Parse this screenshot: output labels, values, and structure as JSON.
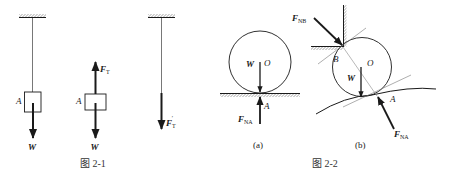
{
  "figure_2_1": {
    "caption": "图 2-1",
    "panel_1": {
      "point_label": "A",
      "weight_label": "W"
    },
    "panel_2": {
      "point_label": "A",
      "weight_label": "W",
      "tension_label": "F",
      "tension_sub": "T"
    },
    "panel_3": {
      "tension_label": "F",
      "tension_sub": "T",
      "tension_prime": "′"
    }
  },
  "figure_2_2": {
    "caption": "图 2-2",
    "panel_a": {
      "label": "(a)",
      "center_label": "O",
      "weight_label": "W",
      "contact_label": "A",
      "normal_label": "F",
      "normal_sub": "NA"
    },
    "panel_b": {
      "label": "(b)",
      "center_label": "O",
      "weight_label": "W",
      "contact_a_label": "A",
      "contact_b_label": "B",
      "normal_a_label": "F",
      "normal_a_sub": "NA",
      "normal_b_label": "F",
      "normal_b_sub": "NB"
    }
  },
  "colors": {
    "ink": "#1a1a1a",
    "rope": "#555555",
    "dashed": "#777777",
    "background": "#ffffff"
  }
}
